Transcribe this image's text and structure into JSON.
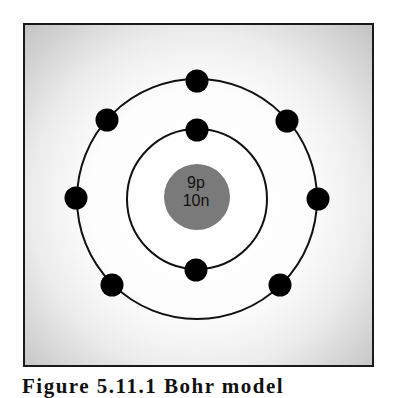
{
  "figure": {
    "caption": "Figure 5.11.1 Bohr model",
    "background": {
      "center_color": "#ffffff",
      "edge_color": "#c4c4c4",
      "border_color": "#1a1a1a"
    }
  },
  "atom": {
    "element": "Fluorine",
    "nucleus": {
      "protons_label": "9p",
      "neutrons_label": "10n",
      "color": "#7a7a7a",
      "center": [
        197,
        198
      ],
      "radius": 33
    },
    "shells": [
      {
        "name": "inner-shell",
        "radius": 70,
        "electron_count": 2,
        "electrons": [
          [
            197,
            130
          ],
          [
            196,
            270
          ]
        ]
      },
      {
        "name": "outer-shell",
        "radius": 120,
        "electron_count": 7,
        "electrons": [
          [
            197,
            81
          ],
          [
            287,
            121
          ],
          [
            318,
            199
          ],
          [
            280,
            285
          ],
          [
            112,
            285
          ],
          [
            76,
            198
          ],
          [
            107,
            120
          ]
        ]
      }
    ],
    "electron_color": "#000000",
    "electron_radius": 11.5,
    "orbit_color": "#111111"
  }
}
